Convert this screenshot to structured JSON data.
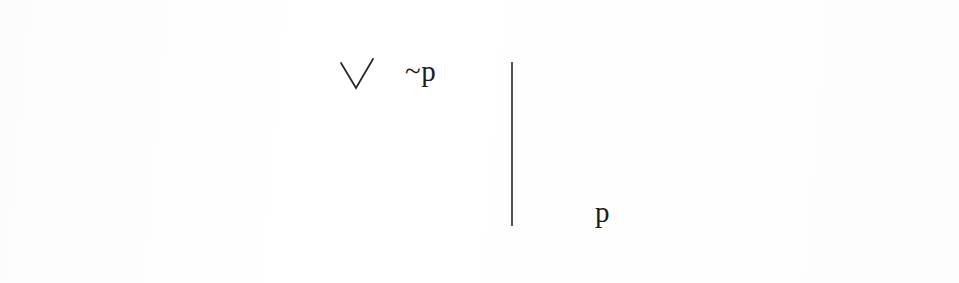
{
  "document": {
    "type": "scanned-logic-diagram",
    "background_color": "#ffffff",
    "ink_color": "#1d1d1d",
    "frame": {
      "name": "rectangular-border",
      "x": 50,
      "y": 21,
      "width": 868,
      "height": 234,
      "stroke_color": "#3a3a3a",
      "stroke_width": 1.6
    },
    "divider": {
      "name": "vertical-divider-line",
      "x": 512,
      "y_top": 62,
      "y_bottom": 226,
      "stroke_color": "#2a2a2a",
      "stroke_width": 1.6
    },
    "checkmark": {
      "name": "check-mark",
      "points": "341,63 356,88 373,59",
      "stroke_color": "#2a2a2a",
      "stroke_width": 1.8
    },
    "labels": {
      "negated_p": "~p",
      "p": "p"
    }
  }
}
